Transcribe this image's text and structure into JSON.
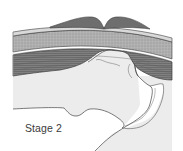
{
  "figure": {
    "label": "Stage 2",
    "colors": {
      "background": "#ffffff",
      "cap": "#6e6e6e",
      "cap_outline": "#3c3c3c",
      "thin_band": "#d8d8d8",
      "stippled_band": "#a9a9a9",
      "muscle_band": "#7d7d7d",
      "bone_fill": "#ececec",
      "outline": "#444444"
    },
    "layers": [
      "cap-left",
      "cap-right",
      "thin-band",
      "stippled-band",
      "white-line",
      "muscle-band",
      "bone-mass"
    ]
  }
}
